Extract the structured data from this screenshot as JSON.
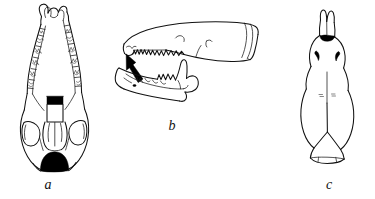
{
  "figure": {
    "background_color": "#ffffff",
    "ink_color": "#111111",
    "solid_fill_color": "#000000",
    "caption_style": "italic-serif",
    "panels": [
      {
        "id": "a",
        "label": "a",
        "view": "ventral (palatal) view of cranium",
        "features": [
          "upper tooth rows with W-shaped (dilambdodont) molar cusps",
          "anterior incisors forming a horseshoe arch",
          "black mesopterygoid fossa (rectangular)",
          "auditory bullae region",
          "black foramen magnum (semicircular)"
        ]
      },
      {
        "id": "b",
        "label": "b",
        "view": "lateral view of cranium with mandible",
        "features": [
          "upper tooth row with unicuspids",
          "solid black pointer arrow indicating anterior tooth",
          "mandible with coronoid process, condyle and angular process",
          "lower tooth row",
          "occipital region at posterior"
        ]
      },
      {
        "id": "c",
        "label": "c",
        "view": "dorsal view of cranium",
        "features": [
          "notched nasal tip",
          "black nasal aperture patch",
          "two black comma-shaped infraorbital marks",
          "sagittal suture line",
          "rounded braincase",
          "occipital margin"
        ]
      }
    ]
  }
}
